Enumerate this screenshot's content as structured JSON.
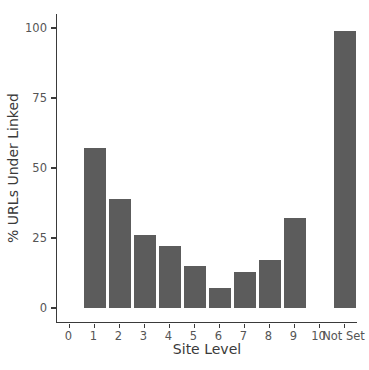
{
  "chart_data": {
    "type": "bar",
    "title": "",
    "xlabel": "Site Level",
    "ylabel": "% URLs Under Linked",
    "categories": [
      "0",
      "1",
      "2",
      "3",
      "4",
      "5",
      "6",
      "7",
      "8",
      "9",
      "10",
      "Not Set"
    ],
    "values": [
      0,
      57,
      39,
      26,
      22,
      15,
      7,
      13,
      17,
      32,
      0,
      99
    ],
    "ylim": [
      -5,
      105
    ],
    "yticks": [
      0,
      25,
      50,
      75,
      100
    ],
    "grid": false,
    "legend": "none",
    "bar_color": "#5c5c5c",
    "axis_color": "#3a3a3a",
    "tick_label_color": "#555555",
    "background_color": "#ffffff"
  }
}
